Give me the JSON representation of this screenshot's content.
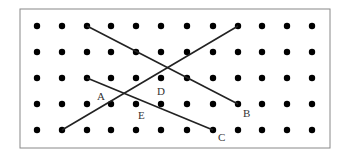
{
  "diagram": {
    "frame": {
      "x": 20,
      "y": 9,
      "width": 310,
      "height": 139,
      "stroke": "#888888"
    },
    "grid": {
      "columns": [
        37,
        62,
        87,
        111,
        136,
        161,
        187,
        213,
        238,
        262,
        287,
        312
      ],
      "rows": [
        26,
        52,
        78,
        104,
        130
      ],
      "dot_radius": 3.2,
      "dot_color": "#000000"
    },
    "segments": [
      {
        "name": "segment-top-left-to-B",
        "x1": 87,
        "y1": 26,
        "x2": 238,
        "y2": 104
      },
      {
        "name": "segment-bottom-left-to-top-right",
        "x1": 62,
        "y1": 130,
        "x2": 238,
        "y2": 26
      },
      {
        "name": "segment-left-to-C",
        "x1": 87,
        "y1": 78,
        "x2": 213,
        "y2": 130
      }
    ],
    "line_color": "#222222",
    "labels": [
      {
        "text": "A",
        "x": 97,
        "y": 100
      },
      {
        "text": "D",
        "x": 157,
        "y": 95
      },
      {
        "text": "E",
        "x": 138,
        "y": 119
      },
      {
        "text": "B",
        "x": 243,
        "y": 117
      },
      {
        "text": "C",
        "x": 218,
        "y": 141
      }
    ]
  }
}
